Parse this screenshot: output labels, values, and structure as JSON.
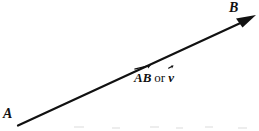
{
  "figure": {
    "type": "vector-diagram",
    "background_color": "#ffffff",
    "stroke_color": "#111111",
    "width": 259,
    "height": 131
  },
  "points": {
    "start": {
      "label": "A",
      "x": 18,
      "y": 125
    },
    "end": {
      "label": "B",
      "x": 255,
      "y": 16
    }
  },
  "vector_label": {
    "notation": "AB",
    "conjunction": "or",
    "alt_notation": "v",
    "full_text": "AB or v"
  }
}
